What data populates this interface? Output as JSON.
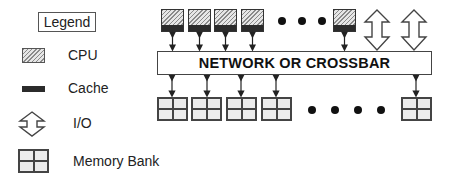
{
  "legend": {
    "title": "Legend",
    "items": [
      {
        "icon": "cpu-icon",
        "label": "CPU"
      },
      {
        "icon": "cache-icon",
        "label": "Cache"
      },
      {
        "icon": "io-icon",
        "label": "I/O"
      },
      {
        "icon": "memory-bank-icon",
        "label": "Memory Bank"
      }
    ]
  },
  "diagram": {
    "network_label": "NETWORK OR CROSSBAR",
    "processor_count_shown": 5,
    "io_count_shown": 2,
    "memory_bank_count_shown": 5,
    "ellipsis_top": "• • •",
    "ellipsis_bottom": "• • • •"
  },
  "colors": {
    "cache": "#2b2b2b",
    "cpu_hatch": "#8a8a8a",
    "memory_fill": "#ececec",
    "outline": "#444444"
  }
}
